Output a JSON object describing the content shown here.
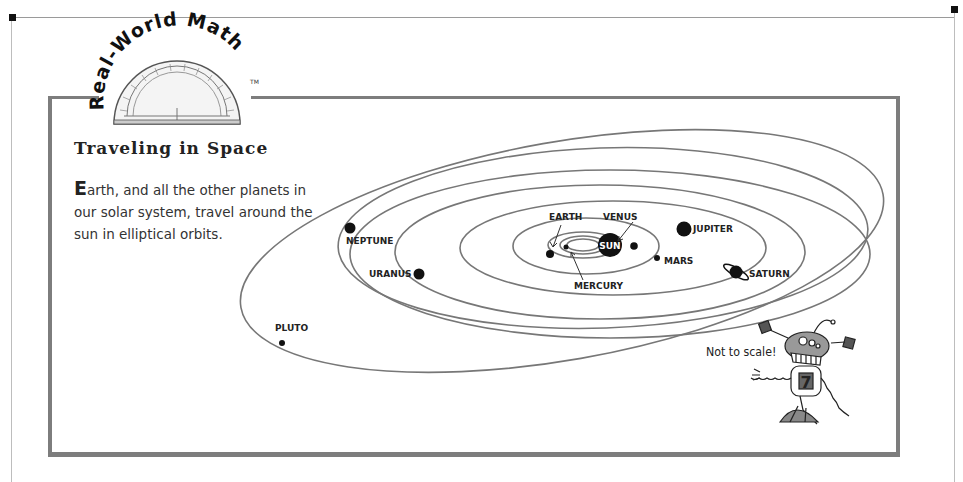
{
  "logo": {
    "text": "Real-World Math",
    "trademark": "TM",
    "icon": "protractor-icon"
  },
  "panel": {
    "title": "Traveling in Space",
    "body_drop_cap": "E",
    "body_rest": "arth, and all the other planets in our solar system, travel around the sun in elliptical orbits.",
    "note": "Not to scale!"
  },
  "diagram": {
    "center_label": "SUN",
    "planets": [
      {
        "name": "MERCURY",
        "label": "MERCURY"
      },
      {
        "name": "VENUS",
        "label": "VENUS"
      },
      {
        "name": "EARTH",
        "label": "EARTH"
      },
      {
        "name": "MARS",
        "label": "MARS"
      },
      {
        "name": "JUPITER",
        "label": "JUPITER"
      },
      {
        "name": "SATURN",
        "label": "SATURN"
      },
      {
        "name": "URANUS",
        "label": "URANUS"
      },
      {
        "name": "NEPTUNE",
        "label": "NEPTUNE"
      },
      {
        "name": "PLUTO",
        "label": "PLUTO"
      }
    ],
    "mascot_number": "7"
  },
  "colors": {
    "frame": "#7d7d7d",
    "orbit": "#777777",
    "planet": "#111111",
    "text": "#222222"
  }
}
